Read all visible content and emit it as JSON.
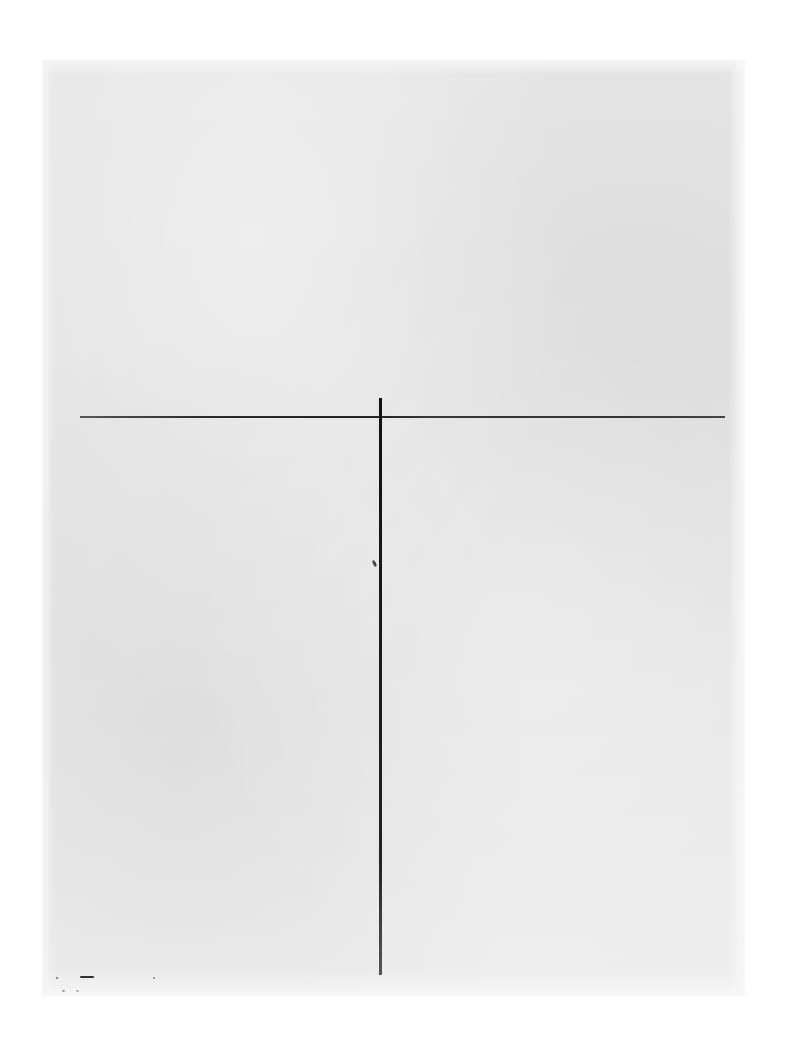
{
  "page": {
    "type": "scanned-blank-sheet",
    "background_color": "#ffffff",
    "paper_color": "#e5e5e5",
    "line_color": "#222222"
  },
  "sheet": {
    "bounds": {
      "left": 42,
      "top": 60,
      "width": 703,
      "height": 936
    }
  },
  "lines": [
    {
      "name": "horizontal-rule",
      "orientation": "horizontal",
      "x1": 80,
      "y1": 417,
      "x2": 725,
      "y2": 417
    },
    {
      "name": "vertical-rule",
      "orientation": "vertical",
      "x1": 380,
      "y1": 398,
      "x2": 380,
      "y2": 975
    }
  ],
  "text": {
    "bleed_through": ""
  }
}
